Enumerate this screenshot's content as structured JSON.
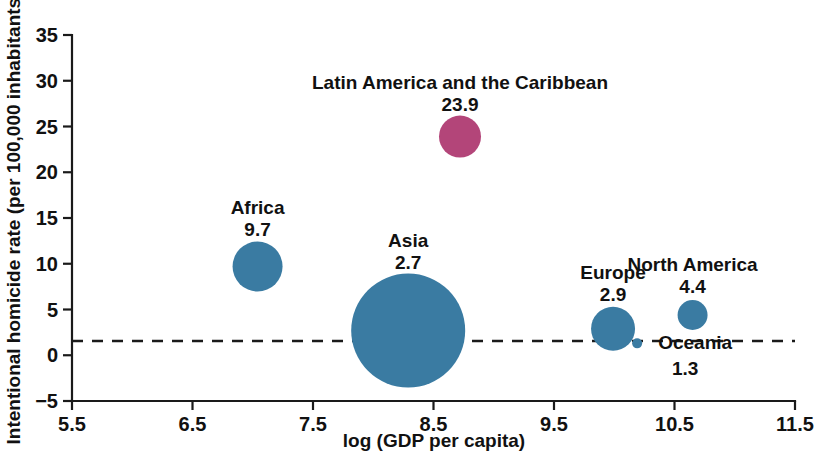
{
  "chart_data": {
    "type": "scatter",
    "title": "",
    "subtitle": "",
    "xlabel": "log (GDP per capita)",
    "ylabel": "Intentional homicide rate (per 100,000 inhabitants)",
    "xlim": [
      5.5,
      11.5
    ],
    "ylim": [
      -5,
      35
    ],
    "xticks": [
      "5.5",
      "6.5",
      "7.5",
      "8.5",
      "9.5",
      "10.5",
      "11.5"
    ],
    "xtick_values": [
      5.5,
      6.5,
      7.5,
      8.5,
      9.5,
      10.5,
      11.5
    ],
    "yticks": [
      "35",
      "30",
      "25",
      "20",
      "15",
      "10",
      "5",
      "0",
      "-5"
    ],
    "ytick_values": [
      35,
      30,
      25,
      20,
      15,
      10,
      5,
      0,
      -5
    ],
    "grid": false,
    "legend": "none",
    "reference_line": {
      "name": "zero-line",
      "y": 0,
      "style": "dashed"
    },
    "bubble_size_encodes": "population",
    "colors": {
      "default_bubble": "#3a7ba2",
      "highlight_bubble": "#b34579",
      "axis": "#1a1a1a",
      "text": "#111111",
      "background": "#ffffff"
    },
    "points": [
      {
        "name": "Latin America and the Caribbean",
        "value_label": "23.9",
        "x": 8.72,
        "y": 23.9,
        "size": 21,
        "color": "#b34579",
        "label_align": "above",
        "name_dy": -48,
        "value_dy": -26
      },
      {
        "name": "Africa",
        "value_label": "9.7",
        "x": 7.04,
        "y": 9.7,
        "size": 25,
        "color": "#3a7ba2",
        "label_align": "above",
        "name_dy": -52,
        "value_dy": -30
      },
      {
        "name": "Asia",
        "value_label": "2.7",
        "x": 8.29,
        "y": 2.7,
        "size": 57,
        "color": "#3a7ba2",
        "label_align": "above",
        "name_dy": -84,
        "value_dy": -62
      },
      {
        "name": "Europe",
        "value_label": "2.9",
        "x": 9.99,
        "y": 2.9,
        "size": 22,
        "color": "#3a7ba2",
        "label_align": "above",
        "name_dy": -50,
        "value_dy": -28
      },
      {
        "name": "North America",
        "value_label": "4.4",
        "x": 10.65,
        "y": 4.4,
        "size": 15,
        "color": "#3a7ba2",
        "label_align": "above",
        "name_dy": -44,
        "value_dy": -22
      },
      {
        "name": "Oceania",
        "value_label": "1.3",
        "x": 10.19,
        "y": 1.3,
        "size": 5,
        "color": "#3a7ba2",
        "label_align": "right-below",
        "name_dx": 58,
        "name_dy": 6,
        "value_dx": 48,
        "value_dy": 32
      }
    ]
  }
}
